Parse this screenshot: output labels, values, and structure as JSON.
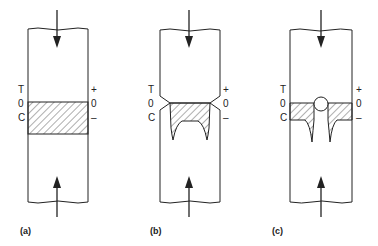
{
  "panels": [
    {
      "id": "a",
      "caption": "(a)",
      "left_labels": [
        "T",
        "0",
        "C"
      ],
      "right_labels": [
        "+",
        "0",
        "–"
      ]
    },
    {
      "id": "b",
      "caption": "(b)",
      "left_labels": [
        "T",
        "0",
        "C"
      ],
      "right_labels": [
        "+",
        "0",
        "–"
      ]
    },
    {
      "id": "c",
      "caption": "(c)",
      "left_labels": [
        "T",
        "0",
        "C"
      ],
      "right_labels": [
        "+",
        "0",
        "–"
      ]
    }
  ],
  "colors": {
    "stroke": "#222222",
    "background": "#ffffff"
  }
}
